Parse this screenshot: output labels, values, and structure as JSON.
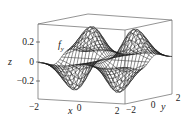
{
  "chart_data": {
    "type": "surface",
    "title": "",
    "annotation": "f_y",
    "xlabel": "x",
    "ylabel": "y",
    "zlabel": "z",
    "x_range": [
      -2,
      2
    ],
    "y_range": [
      -2,
      2
    ],
    "z_range": [
      -0.35,
      0.35
    ],
    "x_ticks": [
      "-2",
      "0",
      "2"
    ],
    "y_ticks": [
      "-2",
      "0",
      "2"
    ],
    "z_ticks": [
      "0.2",
      "0",
      "-0.2"
    ],
    "grid": false,
    "box": true,
    "style": "wireframe",
    "approx_function": "z = 2 * x^2 * y * exp(-(x^2+y^2))",
    "mesh_lines": 26
  },
  "labels": {
    "annotation_main": "f",
    "annotation_sub": "y",
    "x_axis": "x",
    "y_axis": "y",
    "z_axis": "z",
    "xt0": "−2",
    "xt1": "0",
    "xt2": "2",
    "yt0": "−2",
    "yt1": "0",
    "yt2": "2",
    "zt0": "0.2",
    "zt1": "0",
    "zt2": "−0.2"
  },
  "colors": {
    "line": "#1a1a1a",
    "box": "#555555",
    "background": "#ffffff"
  }
}
